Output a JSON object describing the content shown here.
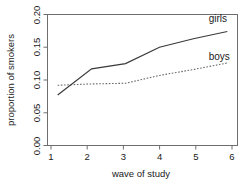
{
  "chart_data": {
    "type": "line",
    "title": "",
    "xlabel": "wave of study",
    "ylabel": "proportion of smokers",
    "x": [
      1,
      2,
      3,
      4,
      5,
      6
    ],
    "xlim": [
      0.7,
      6.3
    ],
    "ylim": [
      0.0,
      0.2
    ],
    "xticks": [
      1,
      2,
      3,
      4,
      5,
      6
    ],
    "xticklabels": [
      "1",
      "2",
      "3",
      "4",
      "5",
      "6"
    ],
    "yticks": [
      0.0,
      0.05,
      0.1,
      0.15,
      0.2
    ],
    "yticklabels": [
      "0.00",
      "0.05",
      "0.10",
      "0.15",
      "0.20"
    ],
    "grid": false,
    "legend_position": "inline-right-of-lines",
    "series": [
      {
        "name": "girls",
        "style": "solid",
        "color": "#3a3a3a",
        "values": [
          0.077,
          0.117,
          0.125,
          0.15,
          0.163,
          0.174
        ],
        "label": "girls",
        "label_x": 5.45,
        "label_y": 0.188
      },
      {
        "name": "boys",
        "style": "dotted",
        "color": "#6a6a6a",
        "values": [
          0.092,
          0.094,
          0.095,
          0.107,
          0.116,
          0.126
        ],
        "label": "boys",
        "label_x": 5.45,
        "label_y": 0.13
      }
    ]
  },
  "axes": {
    "x_title": "wave of study",
    "y_title": "proportion of smokers",
    "x_tick_labels": [
      "1",
      "2",
      "3",
      "4",
      "5",
      "6"
    ],
    "y_tick_labels": [
      "0.00",
      "0.05",
      "0.10",
      "0.15",
      "0.20"
    ]
  },
  "labels": {
    "girls": "girls",
    "boys": "boys"
  },
  "colors": {
    "girls_line": "#3a3a3a",
    "boys_line": "#6a6a6a",
    "axis": "#6e6e6e",
    "text": "#1a1a1a",
    "background": "#ffffff"
  }
}
